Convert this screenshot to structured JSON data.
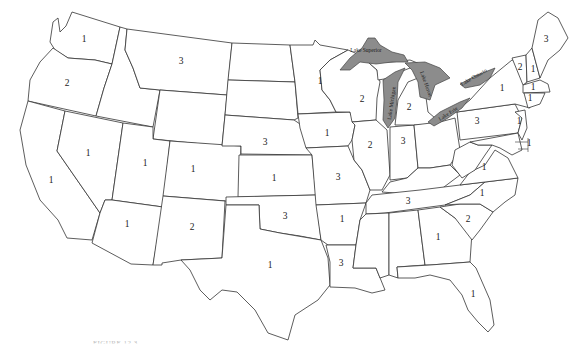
{
  "map": {
    "title": "Contiguous United States — states labeled with numbers",
    "caption": "FIGURE 12.3",
    "lake_fill": "#8c8c8c",
    "lakes": [
      {
        "name": "Lake Superior",
        "x": 362,
        "y": 53,
        "rotate": 0
      },
      {
        "name": "Lake Michigan",
        "x": 389,
        "y": 98,
        "rotate": -80
      },
      {
        "name": "Lake Huron",
        "x": 424,
        "y": 80,
        "rotate": 70
      },
      {
        "name": "Lake Erie",
        "x": 448,
        "y": 116,
        "rotate": -35
      },
      {
        "name": "Lake Ontario",
        "x": 476,
        "y": 80,
        "rotate": -30
      }
    ],
    "state_labels": [
      {
        "state": "Washington",
        "value": "1",
        "x": 84,
        "y": 42
      },
      {
        "state": "Oregon",
        "value": "2",
        "x": 67,
        "y": 86
      },
      {
        "state": "Montana",
        "value": "3",
        "x": 181,
        "y": 64
      },
      {
        "state": "California",
        "value": "1",
        "x": 51,
        "y": 183
      },
      {
        "state": "Nevada",
        "value": "1",
        "x": 88,
        "y": 156
      },
      {
        "state": "Utah",
        "value": "1",
        "x": 145,
        "y": 166
      },
      {
        "state": "Colorado",
        "value": "1",
        "x": 193,
        "y": 172
      },
      {
        "state": "Arizona",
        "value": "1",
        "x": 127,
        "y": 227
      },
      {
        "state": "New Mexico",
        "value": "2",
        "x": 192,
        "y": 230
      },
      {
        "state": "Nebraska",
        "value": "3",
        "x": 265,
        "y": 145
      },
      {
        "state": "Kansas",
        "value": "1",
        "x": 274,
        "y": 181
      },
      {
        "state": "Oklahoma",
        "value": "3",
        "x": 285,
        "y": 219
      },
      {
        "state": "Texas",
        "value": "1",
        "x": 270,
        "y": 268
      },
      {
        "state": "Minnesota",
        "value": "1",
        "x": 320,
        "y": 84
      },
      {
        "state": "Iowa",
        "value": "1",
        "x": 327,
        "y": 136
      },
      {
        "state": "Missouri",
        "value": "3",
        "x": 338,
        "y": 180
      },
      {
        "state": "Arkansas",
        "value": "1",
        "x": 342,
        "y": 222
      },
      {
        "state": "Louisiana",
        "value": "3",
        "x": 341,
        "y": 266
      },
      {
        "state": "Wisconsin",
        "value": "2",
        "x": 362,
        "y": 102
      },
      {
        "state": "Illinois",
        "value": "2",
        "x": 370,
        "y": 148
      },
      {
        "state": "Indiana",
        "value": "3",
        "x": 403,
        "y": 144
      },
      {
        "state": "Michigan",
        "value": "2",
        "x": 409,
        "y": 110
      },
      {
        "state": "Tennessee",
        "value": "3",
        "x": 408,
        "y": 204
      },
      {
        "state": "Georgia",
        "value": "1",
        "x": 438,
        "y": 240
      },
      {
        "state": "South Carolina",
        "value": "2",
        "x": 468,
        "y": 222
      },
      {
        "state": "North Carolina",
        "value": "1",
        "x": 482,
        "y": 196
      },
      {
        "state": "Florida",
        "value": "1",
        "x": 473,
        "y": 297
      },
      {
        "state": "Virginia",
        "value": "1",
        "x": 484,
        "y": 170
      },
      {
        "state": "Pennsylvania",
        "value": "3",
        "x": 477,
        "y": 124
      },
      {
        "state": "New York",
        "value": "1",
        "x": 502,
        "y": 91
      },
      {
        "state": "New Jersey",
        "value": "1",
        "x": 519,
        "y": 124
      },
      {
        "state": "Vermont",
        "value": "2",
        "x": 520,
        "y": 70
      },
      {
        "state": "New Hampshire",
        "value": "1",
        "x": 533,
        "y": 72
      },
      {
        "state": "Maine",
        "value": "3",
        "x": 546,
        "y": 42
      },
      {
        "state": "Massachusetts",
        "value": "1",
        "x": 533,
        "y": 90
      },
      {
        "state": "Connecticut",
        "value": "1",
        "x": 530,
        "y": 101
      },
      {
        "state": "Maryland/Delaware callout",
        "value": "1",
        "x": 529,
        "y": 146
      }
    ]
  }
}
